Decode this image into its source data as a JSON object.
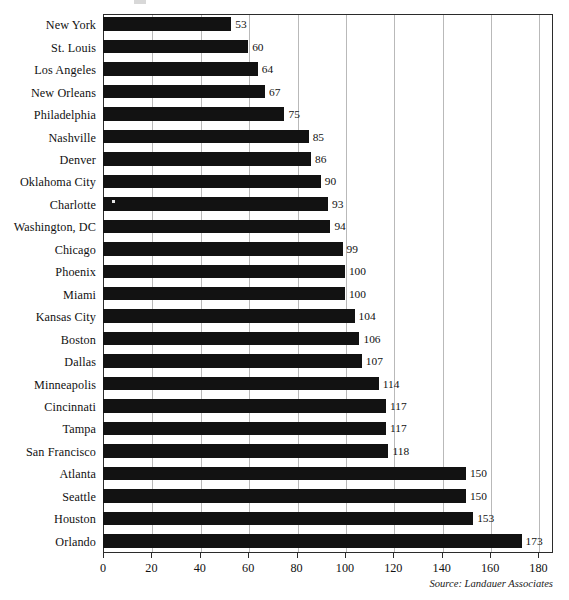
{
  "chart_data": {
    "type": "bar",
    "orientation": "horizontal",
    "title": "",
    "subtitle": "",
    "xlabel": "",
    "ylabel": "",
    "xlim": [
      0,
      186
    ],
    "xticks": [
      0,
      20,
      40,
      60,
      80,
      100,
      120,
      140,
      160,
      180
    ],
    "grid": "vertical",
    "legend": "none",
    "bar_color": "#121212",
    "categories": [
      "New York",
      "St. Louis",
      "Los Angeles",
      "New Orleans",
      "Philadelphia",
      "Nashville",
      "Denver",
      "Oklahoma City",
      "Charlotte",
      "Washington, DC",
      "Chicago",
      "Phoenix",
      "Miami",
      "Kansas City",
      "Boston",
      "Dallas",
      "Minneapolis",
      "Cincinnati",
      "Tampa",
      "San Francisco",
      "Atlanta",
      "Seattle",
      "Houston",
      "Orlando"
    ],
    "values": [
      53,
      60,
      64,
      67,
      75,
      85,
      86,
      90,
      93,
      94,
      99,
      100,
      100,
      104,
      106,
      107,
      114,
      117,
      117,
      118,
      150,
      150,
      153,
      173
    ],
    "value_labels": [
      "53",
      "60",
      "64",
      "67",
      "75",
      "85",
      "86",
      "90",
      "93",
      "94",
      "99",
      "100",
      "100",
      "104",
      "106",
      "107",
      "114",
      "117",
      "117",
      "118",
      "150",
      "150",
      "153",
      "173"
    ],
    "xtick_labels": [
      "0",
      "20",
      "40",
      "60",
      "80",
      "100",
      "120",
      "140",
      "160",
      "180"
    ],
    "annotations": {
      "source": "Source: Landauer Associates"
    }
  }
}
